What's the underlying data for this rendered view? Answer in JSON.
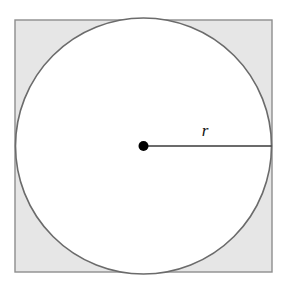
{
  "figure": {
    "canvas": {
      "width": 285,
      "height": 285,
      "background": "#ffffff"
    },
    "square": {
      "name": "square",
      "x": 15,
      "y": 20,
      "width": 257,
      "height": 252,
      "fill": "#e6e6e6",
      "stroke": "#8d8d8d",
      "stroke_width": 1.4
    },
    "circle": {
      "name": "inscribed-circle",
      "cx": 143.5,
      "cy": 146,
      "r": 128,
      "fill": "#ffffff",
      "stroke": "#6b6b6b",
      "stroke_width": 1.6
    },
    "center_point": {
      "name": "center-point",
      "cx": 143.5,
      "cy": 146,
      "r": 5,
      "fill": "#000000"
    },
    "radius_segment": {
      "name": "radius-segment",
      "x1": 143.5,
      "y1": 146,
      "x2": 271.5,
      "y2": 146,
      "stroke": "#3a3a3a",
      "stroke_width": 1.3
    },
    "radius_label": {
      "text": "r",
      "x": 205,
      "y": 136
    }
  }
}
